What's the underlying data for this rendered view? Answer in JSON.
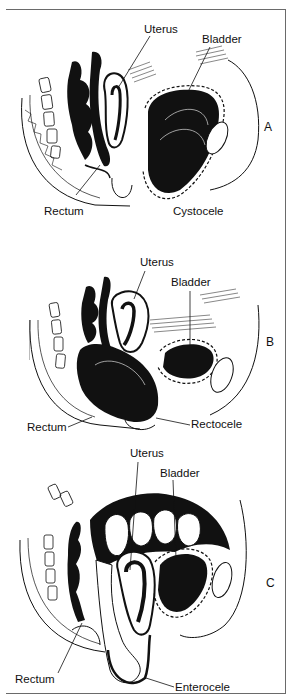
{
  "figure": {
    "panels": [
      {
        "id": "A",
        "letter": "A",
        "condition": "Cystocele",
        "labels": {
          "uterus": "Uterus",
          "bladder": "Bladder",
          "rectum": "Rectum",
          "condition": "Cystocele"
        }
      },
      {
        "id": "B",
        "letter": "B",
        "condition": "Rectocele",
        "labels": {
          "uterus": "Uterus",
          "bladder": "Bladder",
          "rectum": "Rectum",
          "condition": "Rectocele"
        }
      },
      {
        "id": "C",
        "letter": "C",
        "condition": "Enterocele",
        "labels": {
          "uterus": "Uterus",
          "bladder": "Bladder",
          "rectum": "Rectum",
          "condition": "Enterocele"
        }
      }
    ],
    "colors": {
      "ink": "#111111",
      "frame": "#6a6a6a",
      "background": "#ffffff"
    }
  }
}
